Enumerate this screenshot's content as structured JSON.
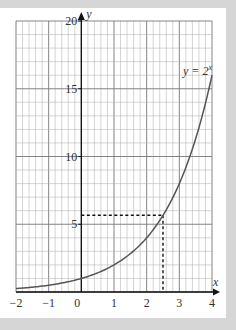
{
  "chart_data": {
    "type": "line",
    "title": "",
    "xlabel": "x",
    "ylabel": "y",
    "xlim": [
      -2,
      4
    ],
    "ylim": [
      0,
      20
    ],
    "x_ticks": [
      "−2",
      "−1",
      "0",
      "1",
      "2",
      "3",
      "4"
    ],
    "y_ticks": [
      "5",
      "10",
      "15",
      "20"
    ],
    "grid": true,
    "grid_minor_x": 0.2,
    "grid_minor_y": 1,
    "series": [
      {
        "name": "y = 2^x",
        "function": "2^x",
        "x": [
          -2,
          -1,
          0,
          0.5,
          1,
          1.5,
          2,
          2.5,
          3,
          3.5,
          4
        ],
        "values": [
          0.25,
          0.5,
          1,
          1.41,
          2,
          2.83,
          4,
          5.66,
          8,
          11.31,
          16
        ]
      }
    ],
    "annotations": [
      {
        "type": "dashed-line",
        "from": [
          0,
          5.66
        ],
        "to": [
          2.5,
          5.66
        ]
      },
      {
        "type": "dashed-line",
        "from": [
          2.5,
          5.66
        ],
        "to": [
          2.5,
          0
        ]
      },
      {
        "type": "label",
        "text": "y = 2^x",
        "at": [
          3.7,
          17
        ]
      }
    ]
  },
  "labels": {
    "curve_label_base": "y = 2",
    "curve_label_exp": "x",
    "x_axis": "x",
    "y_axis": "y"
  }
}
